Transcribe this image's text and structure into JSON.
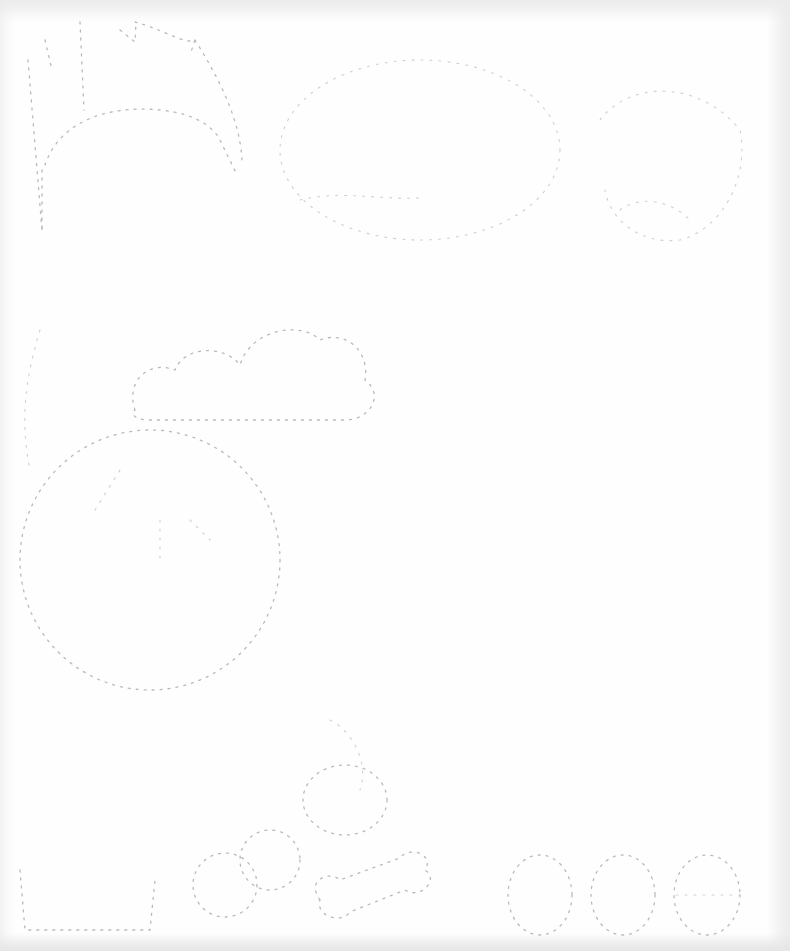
{
  "sheet": {
    "kind": "dotted-line tracing worksheet (scanned)",
    "background": "#fefefe",
    "line_color": "#b9b9b9",
    "text": []
  },
  "shapes": [
    {
      "name": "crown-hat-outline"
    },
    {
      "name": "cloud-outline"
    },
    {
      "name": "large-circle-face"
    },
    {
      "name": "balloon-outline"
    },
    {
      "name": "sock-outline"
    },
    {
      "name": "bone-outline"
    },
    {
      "name": "oval-1"
    },
    {
      "name": "oval-2"
    },
    {
      "name": "oval-3"
    }
  ]
}
